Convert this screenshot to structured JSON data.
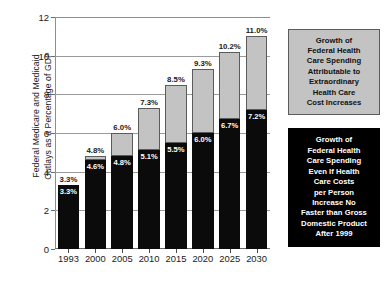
{
  "chart_data": {
    "type": "bar",
    "subtype": "stacked-bar",
    "title": "",
    "xlabel": "",
    "ylabel": "Federal Medicare and Medicaid\nOutlays as a Percentage of GDP",
    "categories": [
      "1993",
      "2000",
      "2005",
      "2010",
      "2015",
      "2020",
      "2025",
      "2030"
    ],
    "ylim": [
      0,
      12
    ],
    "yticks": [
      0,
      2,
      4,
      6,
      8,
      10,
      12
    ],
    "ytick_labels": [
      "0",
      "2",
      "4",
      "6",
      "8",
      "10",
      "12"
    ],
    "grid": true,
    "legend_position": "right",
    "series": [
      {
        "name": "Growth of Federal Health Care Spending Even If Health Care Costs per Person Increase No Faster than Gross Domestic Product After 1999",
        "color": "#0b0b0b",
        "values": [
          3.3,
          4.6,
          4.8,
          5.1,
          5.5,
          6.0,
          6.7,
          7.2
        ],
        "labels": [
          "3.3%",
          "4.6%",
          "4.8%",
          "5.1%",
          "5.5%",
          "6.0%",
          "6.7%",
          "7.2%"
        ]
      },
      {
        "name": "Growth of Federal Health Care Spending Attributable to Extraordinary Health Care Cost Increases",
        "color": "#c3c3c3",
        "values": [
          0.0,
          0.2,
          1.2,
          2.2,
          3.0,
          3.3,
          3.5,
          3.8
        ]
      }
    ],
    "totals": [
      3.3,
      4.8,
      6.0,
      7.3,
      8.5,
      9.3,
      10.2,
      11.0
    ],
    "total_labels": [
      "3.3%",
      "4.8%",
      "6.0%",
      "7.3%",
      "8.5%",
      "9.3%",
      "10.2%",
      "11.0%"
    ]
  },
  "axes": {
    "y_title": "Federal Medicare and Medicaid\nOutlays as a Percentage of GDP",
    "y_ticks": [
      "0",
      "2",
      "4",
      "6",
      "8",
      "10",
      "12"
    ],
    "x_ticks": [
      "1993",
      "2000",
      "2005",
      "2010",
      "2015",
      "2020",
      "2025",
      "2030"
    ]
  },
  "legend": {
    "extra": {
      "text": "Growth of\nFederal Health\nCare Spending\nAttributable to\nExtraordinary\nHealth Care\nCost Increases",
      "fill": "#c3c3c3",
      "text_color": "#111111"
    },
    "base": {
      "text": "Growth of\nFederal Health\nCare Spending\nEven If Health\nCare Costs\nper Person\nIncrease No\nFaster than Gross\nDomestic Product\nAfter 1999",
      "fill": "#000000",
      "text_color": "#ffffff"
    }
  }
}
